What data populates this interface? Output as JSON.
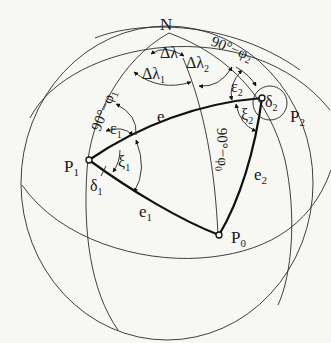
{
  "figure": {
    "colors": {
      "background": "#f7f7f3",
      "ink": "#111111"
    }
  },
  "points": {
    "north_pole": "N",
    "p0": {
      "base": "P",
      "sub": "0"
    },
    "p1": {
      "base": "P",
      "sub": "1"
    },
    "p2": {
      "base": "P",
      "sub": "2"
    }
  },
  "edges": {
    "e": "e",
    "e1": {
      "base": "e",
      "sub": "1"
    },
    "e2": {
      "base": "e",
      "sub": "2"
    }
  },
  "colatitudes": {
    "phi1": {
      "text": "90°−φ",
      "sub": "1"
    },
    "phi2": {
      "text": "90°−φ",
      "sub": "2"
    },
    "phi0": {
      "text": "90°−φ",
      "sub": "0"
    }
  },
  "longitude_differences": {
    "dl": "Δλ",
    "dl1": {
      "base": "Δλ",
      "sub": "1"
    },
    "dl2": {
      "base": "Δλ",
      "sub": "2"
    }
  },
  "angles": {
    "epsilon1": {
      "base": "ε",
      "sub": "1"
    },
    "epsilon2": {
      "base": "ε",
      "sub": "2"
    },
    "xi1": {
      "base": "ξ",
      "sub": "1"
    },
    "xi2": {
      "base": "ξ",
      "sub": "2"
    },
    "delta1": {
      "base": "δ",
      "sub": "1"
    },
    "delta2": {
      "base": "δ",
      "sub": "2"
    }
  }
}
